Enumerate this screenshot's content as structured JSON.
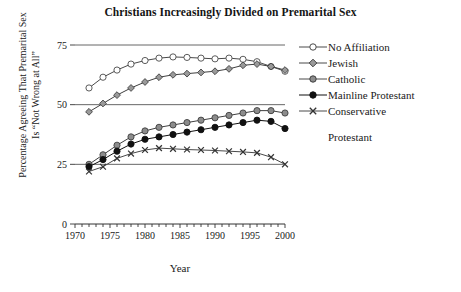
{
  "chart_data": {
    "type": "line",
    "title": "Christians Increasingly Divided on Premarital Sex",
    "xlabel": "Year",
    "ylabel_line1": "Percentage Agreeing That Premarital Sex",
    "ylabel_line2": "Is “Not Wrong at All”",
    "xlim": [
      1970,
      2000
    ],
    "ylim": [
      0,
      75
    ],
    "xticks": [
      1970,
      1975,
      1980,
      1985,
      1990,
      1995,
      2000
    ],
    "xticklabels": [
      "1970",
      "1975",
      "1980",
      "1985",
      "1990",
      "1995",
      "2000"
    ],
    "xminorticks_every": 1,
    "yticks": [
      0,
      25,
      50,
      75
    ],
    "yticklabels": [
      "0",
      "25",
      "50",
      "75"
    ],
    "grid": "horizontal-at-25-50-75",
    "legend_position": "right",
    "x": [
      1972,
      1974,
      1976,
      1978,
      1980,
      1982,
      1984,
      1986,
      1988,
      1990,
      1992,
      1994,
      1996,
      1998,
      2000
    ],
    "series": [
      {
        "name": "No Affiliation",
        "marker": "open-circle",
        "color": "#4a4a4a",
        "fill": "#ffffff",
        "values": [
          57.0,
          61.5,
          64.5,
          67.0,
          68.5,
          69.5,
          70.0,
          69.8,
          69.5,
          69.2,
          69.5,
          69.0,
          68.0,
          66.0,
          64.0
        ]
      },
      {
        "name": "Jewish",
        "marker": "diamond",
        "color": "#3f3f3f",
        "fill": "#9a9a9a",
        "values": [
          47.0,
          50.5,
          54.0,
          57.0,
          59.5,
          61.5,
          62.5,
          63.0,
          63.5,
          64.0,
          65.0,
          66.5,
          67.0,
          66.0,
          64.5
        ]
      },
      {
        "name": "Catholic",
        "marker": "filled-circle",
        "color": "#3f3f3f",
        "fill": "#8c8c8c",
        "values": [
          25.0,
          29.0,
          33.0,
          36.5,
          39.0,
          40.5,
          41.5,
          42.5,
          43.5,
          44.5,
          45.5,
          46.5,
          47.5,
          47.5,
          46.5
        ]
      },
      {
        "name": "Mainline Protestant",
        "marker": "filled-circle",
        "color": "#111111",
        "fill": "#111111",
        "values": [
          24.0,
          27.0,
          30.5,
          33.5,
          35.5,
          36.5,
          37.5,
          38.5,
          39.5,
          40.5,
          41.5,
          42.5,
          43.5,
          43.0,
          40.0
        ]
      },
      {
        "name": "Conservative Protestant",
        "marker": "x-cross",
        "color": "#4a4a4a",
        "fill": "none",
        "values": [
          22.0,
          24.0,
          27.5,
          29.5,
          31.0,
          31.8,
          31.5,
          31.2,
          31.0,
          30.8,
          30.5,
          30.2,
          29.8,
          28.0,
          25.0
        ]
      }
    ]
  },
  "legend": {
    "items": [
      {
        "label": "No Affiliation"
      },
      {
        "label": "Jewish"
      },
      {
        "label": "Catholic"
      },
      {
        "label": "Mainline Protestant"
      },
      {
        "label": "Conservative"
      }
    ],
    "continuation_label": "Protestant"
  }
}
